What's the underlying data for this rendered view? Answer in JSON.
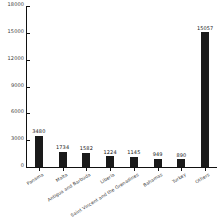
{
  "chart_data": {
    "type": "bar",
    "title": "",
    "subtitle": "",
    "xlabel": "",
    "ylabel": "",
    "ylim": [
      0,
      18000
    ],
    "yticks": [
      0,
      3000,
      6000,
      9000,
      12000,
      15000,
      18000
    ],
    "ytick_labels": [
      "0",
      "3000",
      "6000",
      "9000",
      "12000",
      "15000",
      "18000"
    ],
    "grid": false,
    "legend": false,
    "legend_position": "none",
    "bar_color": "#1a1a1a",
    "categories": [
      "Panama",
      "Malta",
      "Antigua and Barbuda",
      "Liberia",
      "Saint Vincent and the Grenadines",
      "Bahamas",
      "Turkey",
      "Others"
    ],
    "values": [
      3480,
      1734,
      1582,
      1224,
      1145,
      949,
      890,
      15057
    ],
    "data_labels": [
      "3480",
      "1734",
      "1582",
      "1224",
      "1145",
      "949",
      "890",
      "15057"
    ],
    "bars": [
      {
        "category": "Panama",
        "value": 3480,
        "label": "3480"
      },
      {
        "category": "Malta",
        "value": 1734,
        "label": "1734"
      },
      {
        "category": "Antigua and Barbuda",
        "value": 1582,
        "label": "1582"
      },
      {
        "category": "Liberia",
        "value": 1224,
        "label": "1224"
      },
      {
        "category": "Saint Vincent and the Grenadines",
        "value": 1145,
        "label": "1145"
      },
      {
        "category": "Bahamas",
        "value": 949,
        "label": "949"
      },
      {
        "category": "Turkey",
        "value": 890,
        "label": "890"
      },
      {
        "category": "Others",
        "value": 15057,
        "label": "15057"
      }
    ]
  }
}
